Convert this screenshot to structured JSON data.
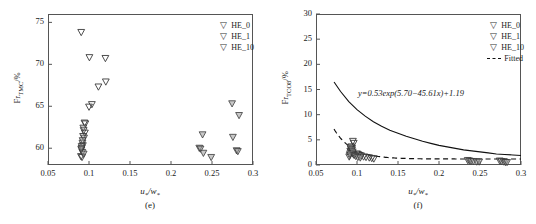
{
  "figure": {
    "panels": [
      {
        "id": "e",
        "sublabel": "(e)",
        "xlabel_num": "u",
        "xlabel_den": "w",
        "ylabel": "Fr",
        "ylabel_sub": "TMC",
        "ylabel_unit": "/%",
        "legend": [
          {
            "marker": "triangle-down",
            "label": "HE_0"
          },
          {
            "marker": "triangle-down",
            "label": "HE_1"
          },
          {
            "marker": "triangle-down",
            "label": "HE_10"
          }
        ]
      },
      {
        "id": "f",
        "sublabel": "(f)",
        "xlabel_num": "u",
        "xlabel_den": "w",
        "ylabel": "Fr",
        "ylabel_sub": "TCO8",
        "ylabel_unit": "/%",
        "equation": "y=0.53exp(5.70−45.61x)+1.19",
        "legend": [
          {
            "marker": "triangle-down",
            "label": "HE_0"
          },
          {
            "marker": "triangle-down",
            "label": "HE_1"
          },
          {
            "marker": "triangle-down",
            "label": "HE_10"
          },
          {
            "marker": "dashed-line",
            "label": "Fitted"
          }
        ]
      }
    ]
  },
  "chart_data": [
    {
      "type": "scatter",
      "panel": "(e)",
      "title": "",
      "xlabel": "u*/w*",
      "ylabel": "Fr_TMC/%",
      "xlim": [
        0.05,
        0.3
      ],
      "ylim": [
        58.0,
        76.0
      ],
      "xticks": [
        "0.05",
        "0.1",
        "0.15",
        "0.2",
        "0.25",
        "0.3"
      ],
      "xtick_values": [
        0.05,
        0.1,
        0.15,
        0.2,
        0.25,
        0.3
      ],
      "yticks": [
        "60",
        "65",
        "70",
        "75"
      ],
      "ytick_values": [
        60,
        65,
        70,
        75
      ],
      "grid": false,
      "legend_position": "top-right",
      "series": [
        {
          "name": "HE_0",
          "marker": "triangle-down",
          "points": [
            [
              0.0905,
              73.8
            ],
            [
              0.1005,
              70.8
            ],
            [
              0.12,
              70.7
            ],
            [
              0.1115,
              67.3
            ],
            [
              0.1205,
              67.9
            ],
            [
              0.1,
              64.9
            ],
            [
              0.1035,
              65.2
            ],
            [
              0.0945,
              63.0
            ],
            [
              0.0955,
              62.9
            ],
            [
              0.0935,
              62.1
            ],
            [
              0.095,
              61.8
            ],
            [
              0.0928,
              61.4
            ],
            [
              0.092,
              60.6
            ],
            [
              0.0925,
              60.3
            ],
            [
              0.0912,
              60.0
            ],
            [
              0.0908,
              59.8
            ],
            [
              0.0918,
              59.5
            ],
            [
              0.0902,
              59.0
            ],
            [
              0.0915,
              58.9
            ]
          ]
        },
        {
          "name": "HE_1",
          "marker": "triangle-down",
          "points": [
            [
              0.2345,
              60.0
            ],
            [
              0.236,
              59.9
            ],
            [
              0.2395,
              59.4
            ],
            [
              0.249,
              58.9
            ],
            [
              0.2385,
              61.6
            ],
            [
              0.2755,
              61.3
            ],
            [
              0.2745,
              65.3
            ],
            [
              0.283,
              63.9
            ],
            [
              0.28,
              59.7
            ],
            [
              0.2815,
              59.6
            ]
          ]
        },
        {
          "name": "HE_10",
          "marker": "triangle-down",
          "points": [
            [
              0.093,
              62.4
            ],
            [
              0.094,
              61.2
            ],
            [
              0.0922,
              60.9
            ],
            [
              0.091,
              60.2
            ],
            [
              0.0905,
              59.9
            ],
            [
              0.0935,
              59.3
            ]
          ]
        }
      ]
    },
    {
      "type": "scatter",
      "panel": "(f)",
      "title": "",
      "xlabel": "u*/w*",
      "ylabel": "Fr_TCO8/%",
      "xlim": [
        0.05,
        0.3
      ],
      "ylim": [
        0,
        30
      ],
      "xticks": [
        "0.05",
        "0.1",
        "0.15",
        "0.2",
        "0.25",
        "0.3"
      ],
      "xtick_values": [
        0.05,
        0.1,
        0.15,
        0.2,
        0.25,
        0.3
      ],
      "yticks": [
        "0",
        "5",
        "10",
        "15",
        "20",
        "25",
        "30"
      ],
      "ytick_values": [
        0,
        5,
        10,
        15,
        20,
        25,
        30
      ],
      "grid": false,
      "legend_position": "top-right",
      "annotation": "y=0.53exp(5.70−45.61x)+1.19",
      "fitted_curve": {
        "name": "Fitted",
        "style": "dashed",
        "equation": "y=0.53*exp(5.70-45.61*x)+1.19",
        "a": 0.53,
        "b": 5.7,
        "c": 45.61,
        "d": 1.19,
        "x_start": 0.072,
        "x_end": 0.3
      },
      "solid_curve": {
        "name": "envelope",
        "style": "solid",
        "x_start": 0.072,
        "x_end": 0.3,
        "points": [
          [
            0.072,
            16.5
          ],
          [
            0.08,
            14.6
          ],
          [
            0.09,
            12.6
          ],
          [
            0.1,
            11.0
          ],
          [
            0.11,
            9.7
          ],
          [
            0.12,
            8.6
          ],
          [
            0.13,
            7.7
          ],
          [
            0.14,
            6.9
          ],
          [
            0.15,
            6.3
          ],
          [
            0.16,
            5.7
          ],
          [
            0.17,
            5.2
          ],
          [
            0.18,
            4.7
          ],
          [
            0.19,
            4.3
          ],
          [
            0.2,
            3.9
          ],
          [
            0.21,
            3.6
          ],
          [
            0.22,
            3.3
          ],
          [
            0.23,
            3.0
          ],
          [
            0.24,
            2.8
          ],
          [
            0.25,
            2.6
          ],
          [
            0.26,
            2.4
          ],
          [
            0.27,
            2.2
          ],
          [
            0.28,
            2.1
          ],
          [
            0.29,
            2.0
          ],
          [
            0.3,
            1.9
          ]
        ]
      },
      "series": [
        {
          "name": "HE_0",
          "marker": "triangle-down",
          "points": [
            [
              0.095,
              4.7
            ],
            [
              0.096,
              4.3
            ],
            [
              0.093,
              3.6
            ],
            [
              0.094,
              3.3
            ],
            [
              0.0925,
              3.1
            ],
            [
              0.0935,
              2.9
            ],
            [
              0.0918,
              2.7
            ],
            [
              0.0928,
              2.5
            ],
            [
              0.0945,
              2.3
            ],
            [
              0.0955,
              2.1
            ],
            [
              0.0912,
              1.9
            ],
            [
              0.0905,
              1.6
            ],
            [
              0.1,
              2.2
            ],
            [
              0.102,
              2.0
            ],
            [
              0.105,
              1.8
            ],
            [
              0.108,
              1.6
            ],
            [
              0.111,
              1.5
            ],
            [
              0.115,
              1.4
            ],
            [
              0.118,
              1.3
            ],
            [
              0.1205,
              1.2
            ]
          ]
        },
        {
          "name": "HE_1",
          "marker": "triangle-down",
          "points": [
            [
              0.235,
              0.9
            ],
            [
              0.237,
              0.8
            ],
            [
              0.239,
              0.7
            ],
            [
              0.242,
              0.7
            ],
            [
              0.246,
              0.6
            ],
            [
              0.249,
              0.6
            ],
            [
              0.274,
              0.8
            ],
            [
              0.276,
              0.7
            ],
            [
              0.279,
              0.6
            ],
            [
              0.281,
              0.5
            ],
            [
              0.283,
              0.5
            ]
          ]
        },
        {
          "name": "HE_10",
          "marker": "triangle-down",
          "points": [
            [
              0.092,
              3.4
            ],
            [
              0.0938,
              3.0
            ],
            [
              0.0948,
              2.6
            ],
            [
              0.0915,
              2.2
            ],
            [
              0.0965,
              1.9
            ],
            [
              0.0985,
              1.7
            ],
            [
              0.101,
              1.5
            ],
            [
              0.104,
              1.4
            ]
          ]
        }
      ]
    }
  ]
}
